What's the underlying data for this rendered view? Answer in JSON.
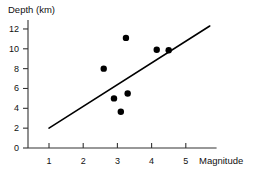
{
  "chart_data": {
    "type": "scatter",
    "title": "",
    "xlabel": "Magnitude",
    "ylabel": "Depth (km)",
    "xlim": [
      0.45,
      5.9
    ],
    "ylim": [
      0,
      12.6
    ],
    "xticks": [
      1,
      2,
      3,
      4,
      5
    ],
    "yticks": [
      0,
      2,
      4,
      6,
      8,
      10,
      12
    ],
    "xtick_labels": [
      "1",
      "2",
      "3",
      "4",
      "5"
    ],
    "ytick_labels": [
      "0",
      "2",
      "4",
      "6",
      "8",
      "10",
      "12"
    ],
    "grid": false,
    "legend": null,
    "marker_color": "#000000",
    "marker_size": 3.2,
    "points": [
      {
        "x": 2.6,
        "y": 8.0
      },
      {
        "x": 2.9,
        "y": 5.0
      },
      {
        "x": 3.1,
        "y": 3.65
      },
      {
        "x": 3.25,
        "y": 11.1
      },
      {
        "x": 3.3,
        "y": 5.5
      },
      {
        "x": 4.15,
        "y": 9.9
      },
      {
        "x": 4.5,
        "y": 9.85
      }
    ],
    "trend_line": {
      "name": "line of best fit",
      "color": "#000000",
      "x_start": 1.0,
      "y_start": 2.0,
      "x_end": 5.7,
      "y_end": 12.3
    },
    "axis_color": "#333333"
  }
}
